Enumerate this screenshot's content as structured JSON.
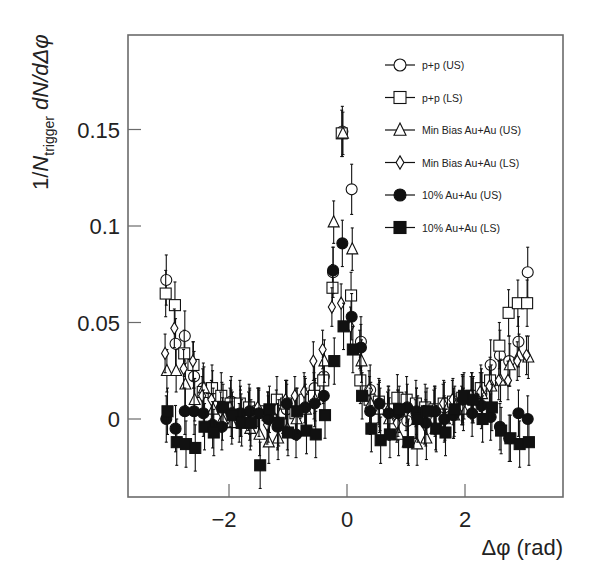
{
  "chart_data": {
    "type": "scatter",
    "title": "",
    "xlabel": "Δφ (rad)",
    "ylabel": "1/N_trigger dN/dΔφ",
    "ylabel_parts": {
      "prefix": "1/",
      "N": "N",
      "sub": "trigger",
      "suffix": " dN/dΔφ"
    },
    "xlim": [
      -3.3,
      3.7
    ],
    "ylim": [
      -0.04,
      0.2
    ],
    "x_ticks": [
      -2,
      0,
      2
    ],
    "x_tick_labels": [
      "−2",
      "0",
      "2"
    ],
    "y_ticks": [
      0,
      0.05,
      0.1,
      0.15
    ],
    "y_tick_labels": [
      "0",
      "0.05",
      "0.1",
      "0.15"
    ],
    "grid": false,
    "legend_position": "upper right (inside)",
    "legend": [
      {
        "label": "p+p  (US)",
        "marker": "open-circle"
      },
      {
        "label": "p+p  (LS)",
        "marker": "open-square"
      },
      {
        "label": "Min Bias Au+Au (US)",
        "marker": "open-triangle"
      },
      {
        "label": "Min Bias Au+Au (LS)",
        "marker": "open-diamond"
      },
      {
        "label": "10% Au+Au (US)",
        "marker": "filled-circle"
      },
      {
        "label": "10% Au+Au (LS)",
        "marker": "filled-square"
      }
    ],
    "nbins": 40,
    "x": [
      -3.063,
      -2.906,
      -2.749,
      -2.592,
      -2.435,
      -2.278,
      -2.121,
      -1.963,
      -1.806,
      -1.649,
      -1.492,
      -1.335,
      -1.178,
      -1.021,
      -0.864,
      -0.707,
      -0.55,
      -0.393,
      -0.236,
      -0.079,
      0.079,
      0.236,
      0.393,
      0.55,
      0.707,
      0.864,
      1.021,
      1.178,
      1.335,
      1.492,
      1.649,
      1.806,
      1.963,
      2.121,
      2.278,
      2.435,
      2.592,
      2.749,
      2.906,
      3.063
    ],
    "series": [
      {
        "name": "p+p  (US)",
        "marker": "open-circle",
        "error": 0.013,
        "values": [
          0.072,
          0.039,
          0.043,
          0.022,
          0.016,
          0.012,
          0.006,
          0.009,
          0.004,
          0.002,
          0.003,
          0.001,
          -0.002,
          0.005,
          0.003,
          0.008,
          0.016,
          0.022,
          0.076,
          0.149,
          0.119,
          0.04,
          0.015,
          0.006,
          0.004,
          0.002,
          -0.001,
          0.003,
          0.001,
          0.004,
          0.006,
          0.003,
          0.01,
          0.011,
          0.013,
          0.028,
          0.033,
          0.03,
          0.04,
          0.076
        ]
      },
      {
        "name": "p+p  (LS)",
        "marker": "open-square",
        "error": 0.012,
        "values": [
          0.065,
          0.059,
          0.034,
          0.028,
          0.014,
          0.016,
          0.012,
          0.008,
          0.008,
          0.006,
          0.004,
          0.002,
          0.01,
          0.008,
          0.003,
          0.01,
          0.012,
          0.02,
          0.068,
          0.148,
          0.064,
          0.02,
          0.01,
          0.009,
          0.005,
          0.011,
          0.01,
          0.008,
          0.006,
          0.005,
          0.008,
          0.009,
          0.011,
          0.012,
          0.016,
          0.02,
          0.038,
          0.055,
          0.06,
          0.06
        ]
      },
      {
        "name": "Min Bias Au+Au (US)",
        "marker": "open-triangle",
        "error": 0.011,
        "values": [
          0.025,
          0.025,
          0.018,
          0.01,
          0.016,
          0.005,
          0.0,
          -0.002,
          0.002,
          -0.005,
          -0.008,
          -0.012,
          -0.01,
          -0.005,
          0.0,
          0.005,
          0.01,
          0.03,
          0.102,
          0.148,
          0.088,
          0.03,
          0.008,
          0.005,
          0.0,
          -0.008,
          -0.012,
          -0.013,
          -0.01,
          -0.005,
          0.0,
          0.002,
          0.005,
          0.01,
          0.013,
          0.017,
          0.02,
          0.028,
          0.033,
          0.032
        ]
      },
      {
        "name": "Min Bias Au+Au (LS)",
        "marker": "open-diamond",
        "error": 0.01,
        "values": [
          0.034,
          0.047,
          0.026,
          0.03,
          0.012,
          0.01,
          0.004,
          0.006,
          -0.002,
          0.004,
          0.006,
          -0.003,
          0.005,
          0.01,
          0.012,
          0.014,
          0.03,
          0.036,
          0.058,
          0.06,
          0.048,
          0.036,
          0.015,
          0.008,
          0.004,
          -0.002,
          0.004,
          0.0,
          -0.003,
          0.005,
          0.008,
          0.01,
          0.007,
          0.012,
          0.014,
          0.017,
          0.02,
          0.02,
          0.03,
          0.033
        ]
      },
      {
        "name": "10% Au+Au (US)",
        "marker": "filled-circle",
        "error": 0.012,
        "values": [
          0.0,
          -0.005,
          0.004,
          0.004,
          0.003,
          -0.003,
          -0.004,
          0.003,
          0.003,
          0.004,
          0.003,
          0.0,
          -0.004,
          0.008,
          -0.008,
          0.006,
          0.008,
          0.012,
          0.077,
          0.091,
          0.053,
          0.037,
          0.004,
          0.008,
          0.003,
          0.003,
          0.006,
          0.004,
          -0.002,
          0.004,
          0.0,
          0.002,
          0.01,
          0.003,
          0.007,
          0.001,
          -0.004,
          -0.01,
          0.003,
          0.0
        ]
      },
      {
        "name": "10% Au+Au (LS)",
        "marker": "filled-square",
        "error": 0.012,
        "values": [
          0.004,
          -0.012,
          -0.013,
          -0.015,
          -0.004,
          -0.007,
          0.006,
          0.002,
          -0.002,
          -0.002,
          -0.024,
          0.005,
          -0.002,
          -0.007,
          0.004,
          -0.006,
          -0.008,
          0.002,
          0.03,
          0.048,
          0.036,
          0.012,
          -0.005,
          -0.011,
          -0.008,
          0.005,
          -0.012,
          0.0,
          0.004,
          -0.005,
          -0.007,
          0.005,
          0.012,
          0.01,
          0.0,
          0.006,
          -0.006,
          -0.01,
          -0.013,
          -0.012
        ]
      }
    ]
  },
  "styles": {
    "frame_color": "#6b6b6b",
    "marker_color": "#111111",
    "background": "#ffffff"
  }
}
